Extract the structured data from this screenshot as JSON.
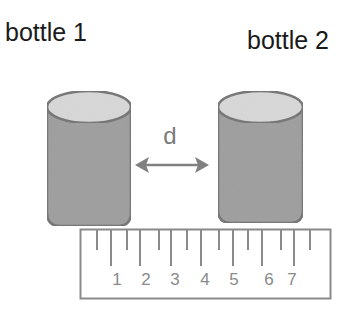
{
  "labels": {
    "bottle_1": "bottle 1",
    "bottle_2": "bottle 2",
    "distance": "d"
  },
  "ruler": {
    "numbers": [
      "1",
      "2",
      "3",
      "4",
      "5",
      "6",
      "7"
    ]
  },
  "colors": {
    "text": "#1a1a1a",
    "bottle_body": "#9a9a9a",
    "bottle_top": "#d8d8d8",
    "bottle_outline": "#6e6e6e",
    "arrow": "#808080",
    "ruler_line": "#8a8a8a"
  }
}
